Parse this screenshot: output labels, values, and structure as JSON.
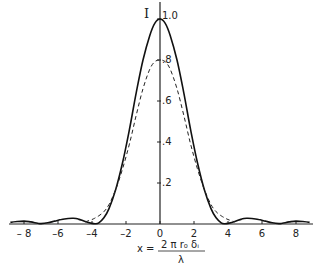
{
  "chart_data": {
    "type": "line",
    "title": "",
    "xlabel": "x = 2πr₀δᵢ / λ",
    "ylabel": "I",
    "xlim": [
      -9,
      9
    ],
    "ylim": [
      0,
      1.0
    ],
    "grid": false,
    "legend": null,
    "x_ticks": [
      -8,
      -6,
      -4,
      -2,
      0,
      2,
      4,
      6,
      8
    ],
    "x_tick_labels": [
      "– 8",
      "–6",
      "–4",
      "–2",
      "0",
      "2",
      "4",
      "6",
      "8"
    ],
    "y_ticks": [
      0.2,
      0.4,
      0.6,
      0.8,
      1.0
    ],
    "y_tick_labels": [
      ".2",
      ".4",
      ".6",
      ".8",
      "1.0"
    ],
    "x": [
      -8.8,
      -8.4,
      -8.0,
      -7.6,
      -7.2,
      -7.0,
      -6.6,
      -6.2,
      -5.8,
      -5.4,
      -5.1,
      -4.8,
      -4.4,
      -4.0,
      -3.8,
      -3.6,
      -3.3,
      -3.0,
      -2.6,
      -2.2,
      -1.8,
      -1.4,
      -1.0,
      -0.6,
      -0.3,
      0,
      0.3,
      0.6,
      1.0,
      1.4,
      1.8,
      2.2,
      2.6,
      3.0,
      3.3,
      3.6,
      3.8,
      4.0,
      4.4,
      4.8,
      5.1,
      5.4,
      5.8,
      6.2,
      6.6,
      7.0,
      7.2,
      7.6,
      8.0,
      8.4,
      8.8
    ],
    "series": [
      {
        "name": "solid",
        "style": "solid",
        "values": [
          0.008,
          0.012,
          0.014,
          0.01,
          0.004,
          0.002,
          0.006,
          0.014,
          0.022,
          0.027,
          0.028,
          0.024,
          0.012,
          0.003,
          0.001,
          0.006,
          0.03,
          0.075,
          0.17,
          0.3,
          0.46,
          0.64,
          0.8,
          0.92,
          0.98,
          1.0,
          0.98,
          0.92,
          0.8,
          0.64,
          0.46,
          0.3,
          0.17,
          0.075,
          0.03,
          0.006,
          0.001,
          0.003,
          0.012,
          0.024,
          0.028,
          0.027,
          0.022,
          0.014,
          0.006,
          0.002,
          0.004,
          0.01,
          0.014,
          0.012,
          0.008
        ]
      },
      {
        "name": "dashed",
        "style": "dashed",
        "values": [
          null,
          null,
          null,
          null,
          null,
          null,
          null,
          null,
          null,
          null,
          null,
          null,
          0.01,
          0.022,
          0.03,
          0.04,
          0.06,
          0.095,
          0.17,
          0.27,
          0.39,
          0.53,
          0.66,
          0.755,
          0.792,
          0.8,
          0.792,
          0.755,
          0.66,
          0.53,
          0.39,
          0.27,
          0.17,
          0.095,
          0.06,
          0.04,
          0.03,
          0.022,
          0.01,
          null,
          null,
          null,
          null,
          null,
          null,
          null,
          null,
          null,
          null,
          null,
          null
        ]
      }
    ]
  }
}
